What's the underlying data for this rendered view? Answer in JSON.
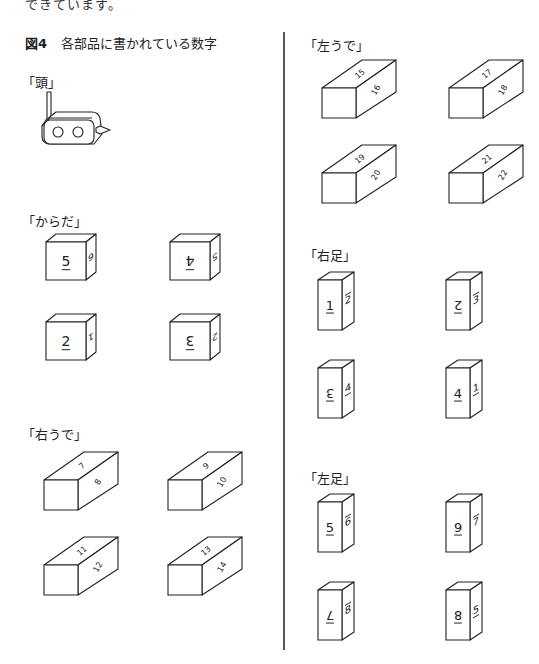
{
  "page": {
    "top_fragment": "できています。",
    "figure_number": "図4",
    "figure_title": "各部品に書かれている数字"
  },
  "sections": {
    "head": {
      "label": "「頭」"
    },
    "body": {
      "label": "「からだ」",
      "blocks": [
        {
          "front": "5",
          "front_mark": "underline",
          "side": "6",
          "side_rotated": true
        },
        {
          "front": "4",
          "front_mark": "overline",
          "front_inverted": true,
          "side": "5",
          "side_rotated": true
        },
        {
          "front": "2",
          "front_mark": "underline",
          "side": "1",
          "side_rotated": true
        },
        {
          "front": "3",
          "front_mark": "overline",
          "front_inverted": true,
          "side": "2",
          "side_rotated": true
        }
      ]
    },
    "right_arm": {
      "label": "「右うで」",
      "blocks": [
        {
          "top": "7",
          "side": "8"
        },
        {
          "top": "9",
          "side": "10"
        },
        {
          "top": "11",
          "side": "12"
        },
        {
          "top": "13",
          "side": "14"
        }
      ]
    },
    "left_arm": {
      "label": "「左うで」",
      "blocks": [
        {
          "top": "15",
          "side": "16"
        },
        {
          "top": "17",
          "side": "18"
        },
        {
          "top": "19",
          "side": "20"
        },
        {
          "top": "21",
          "side": "22"
        }
      ]
    },
    "right_leg": {
      "label": "「右足」",
      "blocks": [
        {
          "front": "1",
          "front_mark": "underline",
          "side": "2",
          "side_mark": "overline"
        },
        {
          "front": "2",
          "front_mark": "overline",
          "front_inverted": true,
          "side": "3",
          "side_mark": "overline"
        },
        {
          "front": "3",
          "front_mark": "overline",
          "front_inverted": true,
          "side": "4",
          "side_mark": "underline"
        },
        {
          "front": "4",
          "front_mark": "underline",
          "side": "1",
          "side_mark": "underline"
        }
      ]
    },
    "left_leg": {
      "label": "「左足」",
      "blocks": [
        {
          "front": "5",
          "front_mark": "underline",
          "side": "6",
          "side_mark": "overline"
        },
        {
          "front": "6",
          "front_mark": "overline",
          "front_inverted": true,
          "side": "7",
          "side_mark": "overline"
        },
        {
          "front": "7",
          "front_mark": "overline",
          "front_inverted": true,
          "side": "8",
          "side_mark": "overline"
        },
        {
          "front": "8",
          "front_mark": "overline",
          "front_inverted": true,
          "side": "5",
          "side_mark": "underline"
        }
      ]
    }
  }
}
